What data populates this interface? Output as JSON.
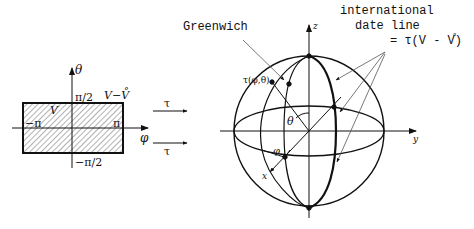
{
  "left_panel": {
    "axis_theta_label": "θ",
    "axis_phi_label": "φ",
    "top_label": "π/2",
    "bottom_label": "−π/2",
    "left_label": "−π",
    "right_label": "π",
    "region_label": "V",
    "corner_label": "V−V̊"
  },
  "mapping_arrows": [
    {
      "label": "τ"
    },
    {
      "label": "τ"
    }
  ],
  "sphere": {
    "axis_z_label": "z",
    "axis_y_label": "y",
    "axis_x_label": "x",
    "angle_theta_label": "θ",
    "angle_phi_label": "φ",
    "point_label": "τ(φ,θ)",
    "greenwich_label": "Greenwich",
    "date_line_label_line1": "international",
    "date_line_label_line2": "date line",
    "date_line_label_line3": "= τ(V - V̊)"
  },
  "colors": {
    "ink": "#111111",
    "hatch": "#555555",
    "leader": "#666666"
  }
}
